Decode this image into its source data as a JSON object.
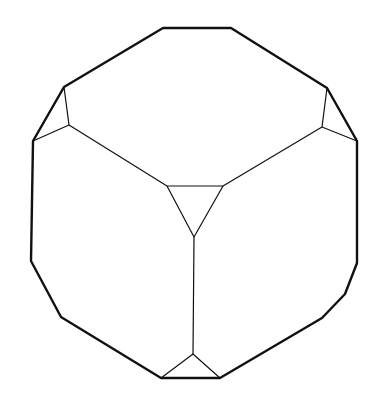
{
  "diagram": {
    "stroke_color": "#111111",
    "background": "#ffffff",
    "outline_points": "163,28 231,28 327,88 357,141 357,263 345,294 322,318 220,378 161,378 61,317 31,261 33,141 64,87",
    "left_triangle": "64,87 69,125 33,141",
    "right_triangle": "327,88 322,127 357,141",
    "center_triangle": "167,186 223,186 194,237",
    "bottom_triangle": "161,378 193,354 220,378",
    "edges": [
      {
        "x1": 69,
        "y1": 125,
        "x2": 167,
        "y2": 186
      },
      {
        "x1": 322,
        "y1": 127,
        "x2": 223,
        "y2": 186
      },
      {
        "x1": 194,
        "y1": 237,
        "x2": 193,
        "y2": 354
      }
    ]
  }
}
